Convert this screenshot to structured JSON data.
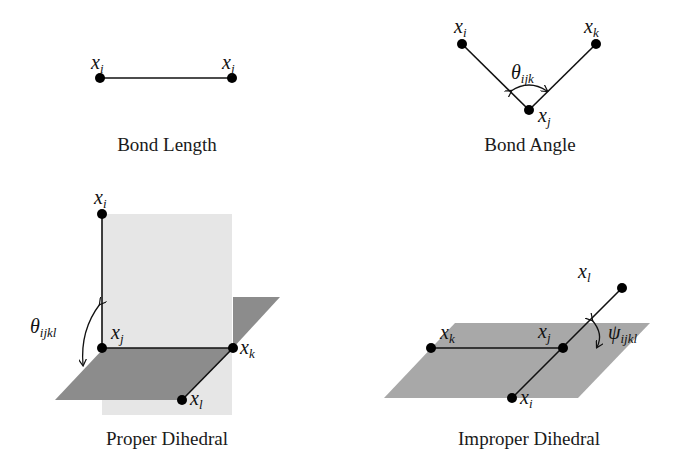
{
  "panels": {
    "bond_length": {
      "caption": "Bond Length",
      "atoms": [
        {
          "symbol": "x",
          "sub": "i"
        },
        {
          "symbol": "x",
          "sub": "j"
        }
      ]
    },
    "bond_angle": {
      "caption": "Bond Angle",
      "atoms": [
        {
          "symbol": "x",
          "sub": "i"
        },
        {
          "symbol": "x",
          "sub": "k"
        },
        {
          "symbol": "x",
          "sub": "j"
        }
      ],
      "angle": {
        "symbol": "θ",
        "sub": "ijk"
      }
    },
    "proper_dihedral": {
      "caption": "Proper Dihedral",
      "atoms": [
        {
          "symbol": "x",
          "sub": "i"
        },
        {
          "symbol": "x",
          "sub": "j"
        },
        {
          "symbol": "x",
          "sub": "k"
        },
        {
          "symbol": "x",
          "sub": "l"
        }
      ],
      "angle": {
        "symbol": "θ",
        "sub": "ijkl"
      }
    },
    "improper_dihedral": {
      "caption": "Improper Dihedral",
      "atoms": [
        {
          "symbol": "x",
          "sub": "l"
        },
        {
          "symbol": "x",
          "sub": "k"
        },
        {
          "symbol": "x",
          "sub": "j"
        },
        {
          "symbol": "x",
          "sub": "i"
        }
      ],
      "angle": {
        "symbol": "ψ",
        "sub": "ijkl"
      }
    }
  },
  "colors": {
    "light_plane": "#e6e6e6",
    "dark_plane": "#8c8c8c",
    "mid_plane": "#a8a8a8",
    "line": "#111111",
    "atom": "#000000"
  }
}
